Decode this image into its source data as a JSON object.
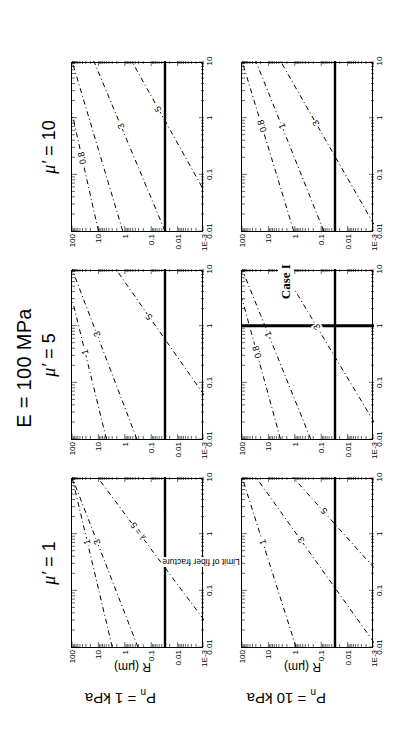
{
  "figure": {
    "title": "E = 100 MPa",
    "col_headers": [
      "μ′ = 1",
      "μ′ = 5",
      "μ′ = 10"
    ],
    "row_labels": [
      "Pₙ = 1 kPa",
      "Pₙ = 10 kPa"
    ],
    "y_axis_title": "R (μm)",
    "y_ticks": [
      "100",
      "10",
      "1",
      "0.1",
      "0.01",
      "1E-3"
    ],
    "x_ticks": [
      "0.01",
      "0.1",
      "1",
      "10"
    ],
    "annotations": {
      "limit": "Limit of fiber fracture",
      "case": "Case I"
    },
    "line_colors": {
      "axis": "#000000",
      "contour": "#000000",
      "limit_line": "#000000",
      "case_line": "#000000"
    }
  },
  "chart_data": {
    "type": "line",
    "title": "E = 100 MPa",
    "xlabel": "",
    "ylabel": "R (μm)",
    "xscale": "log",
    "yscale": "log",
    "xlim": [
      0.01,
      10
    ],
    "ylim": [
      0.001,
      100
    ],
    "grid": false,
    "legend": "inline contour labels",
    "panels": [
      {
        "row": "Pₙ = 1 kPa",
        "col": "μ′ = 1",
        "contours": [
          {
            "label": "1",
            "lambda": 1,
            "points": [
              [
                0.01,
                3.0
              ],
              [
                10.0,
                100.0
              ]
            ]
          },
          {
            "label": "3",
            "lambda": 3,
            "points": [
              [
                0.01,
                0.32
              ],
              [
                10.0,
                100.0
              ]
            ]
          },
          {
            "label": "λ = 5",
            "lambda": 5,
            "points": [
              [
                0.03,
                0.001
              ],
              [
                10.0,
                11.0
              ]
            ]
          }
        ],
        "limit_line": {
          "value": 0.03,
          "label": "Limit of fiber fracture"
        },
        "case_line": null
      },
      {
        "row": "Pₙ = 1 kPa",
        "col": "μ′ = 5",
        "contours": [
          {
            "label": "1",
            "lambda": 1,
            "points": [
              [
                0.01,
                5.0
              ],
              [
                3.0,
                100.0
              ]
            ]
          },
          {
            "label": "3",
            "lambda": 3,
            "points": [
              [
                0.01,
                0.35
              ],
              [
                10.0,
                100.0
              ]
            ]
          },
          {
            "label": "5",
            "lambda": 5,
            "points": [
              [
                0.06,
                0.001
              ],
              [
                10.0,
                2.2
              ]
            ]
          }
        ],
        "limit_line": {
          "value": 0.03,
          "label": null
        },
        "case_line": null
      },
      {
        "row": "Pₙ = 1 kPa",
        "col": "μ′ = 10",
        "contours": [
          {
            "label": "0.8",
            "lambda": 0.8,
            "points": [
              [
                0.01,
                10.0
              ],
              [
                1.2,
                100.0
              ]
            ]
          },
          {
            "label": "",
            "lambda": 1,
            "points": [
              [
                0.01,
                1.2
              ],
              [
                10.0,
                100.0
              ]
            ]
          },
          {
            "label": "3",
            "lambda": 3,
            "points": [
              [
                0.01,
                0.03
              ],
              [
                10.0,
                15.0
              ]
            ]
          },
          {
            "label": "5",
            "lambda": 5,
            "points": [
              [
                0.06,
                0.0012
              ],
              [
                10.0,
                0.55
              ]
            ]
          }
        ],
        "limit_line": {
          "value": 0.03,
          "label": null
        },
        "case_line": null
      },
      {
        "row": "Pₙ = 10 kPa",
        "col": "μ′ = 1",
        "contours": [
          {
            "label": "1",
            "lambda": 1,
            "points": [
              [
                0.01,
                0.9
              ],
              [
                10.0,
                100.0
              ]
            ]
          },
          {
            "label": "3",
            "lambda": 3,
            "points": [
              [
                0.012,
                0.001
              ],
              [
                10.0,
                30.0
              ]
            ]
          },
          {
            "label": "5",
            "lambda": 5,
            "points": [
              [
                0.25,
                0.001
              ],
              [
                10.0,
                1.2
              ]
            ]
          }
        ],
        "limit_line": {
          "value": 0.03,
          "label": null
        },
        "case_line": null
      },
      {
        "row": "Pₙ = 10 kPa",
        "col": "μ′ = 5",
        "contours": [
          {
            "label": "0.8",
            "lambda": 0.8,
            "points": [
              [
                0.01,
                3.5
              ],
              [
                3.0,
                100.0
              ]
            ]
          },
          {
            "label": "1",
            "lambda": 1,
            "points": [
              [
                0.01,
                0.25
              ],
              [
                10.0,
                100.0
              ]
            ]
          },
          {
            "label": "3",
            "lambda": 3,
            "points": [
              [
                0.02,
                0.001
              ],
              [
                10.0,
                3.0
              ]
            ]
          }
        ],
        "limit_line": {
          "value": 0.03,
          "label": null
        },
        "case_line": {
          "value": 1.0,
          "label": "Case I"
        }
      },
      {
        "row": "Pₙ = 10 kPa",
        "col": "μ′ = 10",
        "contours": [
          {
            "label": "0.8",
            "lambda": 0.8,
            "points": [
              [
                0.01,
                1.1
              ],
              [
                10.0,
                100.0
              ]
            ]
          },
          {
            "label": "1",
            "lambda": 1,
            "points": [
              [
                0.01,
                0.08
              ],
              [
                10.0,
                30.0
              ]
            ]
          },
          {
            "label": "3",
            "lambda": 3,
            "points": [
              [
                0.013,
                0.001
              ],
              [
                10.0,
                3.5
              ]
            ]
          }
        ],
        "limit_line": {
          "value": 0.03,
          "label": null
        },
        "case_line": null
      }
    ]
  }
}
